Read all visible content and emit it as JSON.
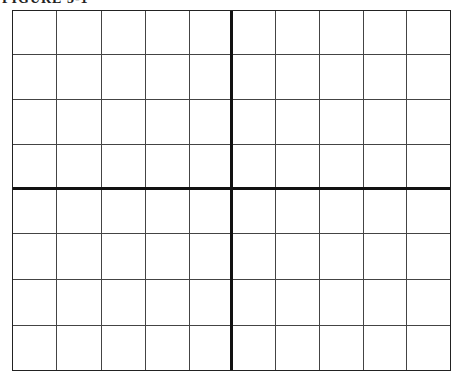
{
  "caption": "FIGURE 3-1",
  "grid": {
    "columns": 10,
    "rows": 8,
    "x_axis_row_index": 4,
    "y_axis_col_index": 5,
    "line_color": "#444444",
    "axis_color": "#111111"
  }
}
